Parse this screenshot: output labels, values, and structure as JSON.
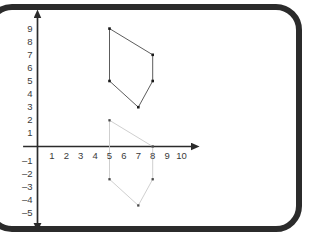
{
  "figure": {
    "title": "",
    "frame_color": "#2b2b2b",
    "background_color": "#ffffff",
    "axis_color": "#2b2b2b",
    "label_color": "#3a3a3a"
  },
  "chart_data": {
    "type": "scatter",
    "title": "",
    "xlabel": "",
    "ylabel": "",
    "xlim": [
      -1,
      11
    ],
    "ylim": [
      -6,
      9.8
    ],
    "grid": false,
    "legend": false,
    "legend_position": "none",
    "x_ticks": [
      1,
      2,
      3,
      4,
      5,
      6,
      7,
      8,
      9,
      10
    ],
    "x_tick_labels": [
      "1",
      "2",
      "3",
      "4",
      "5",
      "6",
      "7",
      "8",
      "9",
      "10"
    ],
    "y_ticks": [
      9,
      8,
      7,
      6,
      5,
      4,
      3,
      2,
      1,
      -1,
      -2,
      -3,
      -4,
      -5
    ],
    "y_tick_labels": [
      "9",
      "8",
      "7",
      "6",
      "5",
      "4",
      "3",
      "2",
      "1",
      "–1",
      "–2",
      "–3",
      "–4",
      "–5"
    ],
    "axes": {
      "x_axis_arrow": "right",
      "y_axis_arrow_top": "up",
      "y_axis_arrow_bottom": "down",
      "origin": [
        0,
        0
      ]
    },
    "series": [
      {
        "name": "upper-pentagon",
        "shape": "pentagon",
        "closed": true,
        "stroke": "#4a4a4a",
        "stroke_width": 0.9,
        "point_color": "#1a1a1a",
        "point_size": 2.6,
        "points": [
          {
            "x": 5,
            "y": 9
          },
          {
            "x": 8,
            "y": 7
          },
          {
            "x": 8,
            "y": 5
          },
          {
            "x": 7,
            "y": 3
          },
          {
            "x": 5,
            "y": 5
          }
        ]
      },
      {
        "name": "lower-pentagon",
        "shape": "pentagon",
        "closed": true,
        "stroke": "#c9c9c9",
        "stroke_width": 0.9,
        "point_color": "#4a4a4a",
        "point_size": 2.3,
        "points": [
          {
            "x": 5,
            "y": 2
          },
          {
            "x": 8,
            "y": 0
          },
          {
            "x": 8,
            "y": -2.5
          },
          {
            "x": 7,
            "y": -4.5
          },
          {
            "x": 5,
            "y": -2.5
          }
        ]
      }
    ]
  }
}
